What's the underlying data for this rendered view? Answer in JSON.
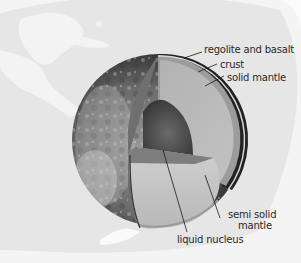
{
  "diagram": {
    "title": "",
    "colors": {
      "background": "#f4f4f4",
      "background_map": "#e6e6e6",
      "background_land": "#f7f7f7",
      "regolite": "#2a2a2a",
      "crust": "#9a9a9a",
      "solid_mantle": "#b9b9b9",
      "semi_solid_mantle": "#c4c4c4",
      "cut_face_side": "#7a7a7a",
      "nucleus": "#4a4a4a",
      "leader_line": "#1a1a1a",
      "text": "#2a2a2a"
    },
    "labels": [
      {
        "id": "regolite",
        "text": "regolite and basalt"
      },
      {
        "id": "crust",
        "text": "crust"
      },
      {
        "id": "solid-mantle",
        "text": "solid mantle"
      },
      {
        "id": "semi-solid-mantle-1",
        "text": "semi solid"
      },
      {
        "id": "semi-solid-mantle-2",
        "text": "mantle"
      },
      {
        "id": "liquid-nucleus",
        "text": "liquid nucleus"
      }
    ]
  }
}
